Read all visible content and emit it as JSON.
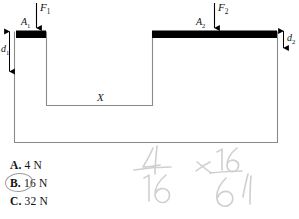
{
  "figure": {
    "labels": {
      "force_left": "F",
      "force_left_sub": "1",
      "force_right": "F",
      "force_right_sub": "2",
      "area_left": "A",
      "area_left_sub": "1",
      "area_right": "A",
      "area_right_sub": "2",
      "depth_left": "d",
      "depth_left_sub": "1",
      "depth_right": "d",
      "depth_right_sub": "2",
      "fluid_level": "X"
    },
    "colors": {
      "piston": "#000000",
      "outline": "#8a8a8a",
      "arrow": "#000000",
      "circle_mark": "#8d8d8d",
      "pencil": "#9a9a9a"
    }
  },
  "answers": {
    "selected": "B",
    "options": [
      {
        "letter": "A.",
        "value": "4 N"
      },
      {
        "letter": "B.",
        "value": "16 N"
      },
      {
        "letter": "C.",
        "value": "32 N"
      }
    ]
  },
  "handwriting": {
    "notes": [
      "4/16",
      "16/64"
    ]
  }
}
